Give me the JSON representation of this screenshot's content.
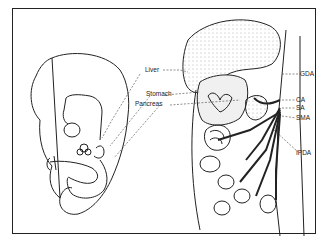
{
  "figure": {
    "type": "anatomical illustration",
    "panels": [
      {
        "id": "embryo",
        "description": "Lateral view of embryo showing developing gut"
      },
      {
        "id": "detail",
        "description": "Enlarged view of foregut organs and arterial supply"
      }
    ]
  },
  "labels": {
    "liver": "Liver",
    "stomach": "Stomach",
    "pancreas": "Pancreas",
    "gda": "GDA",
    "ca": "CA",
    "sa": "SA",
    "sma": "SMA",
    "ipda": "IPDA"
  },
  "colors": {
    "line": "#222222",
    "stipple": "#cfcfcf",
    "background": "#ffffff"
  }
}
